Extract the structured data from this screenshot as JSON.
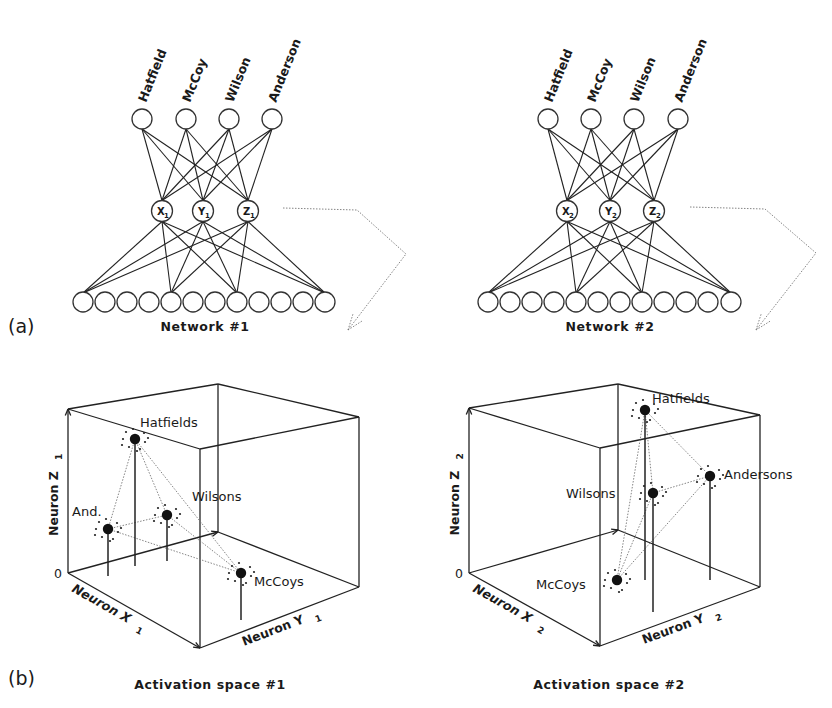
{
  "figure": {
    "panel_a_label": "(a)",
    "panel_b_label": "(b)",
    "colors": {
      "ink": "#1a1a1a",
      "node_stroke": "#333333",
      "dotted": "#777777",
      "background": "#ffffff"
    }
  },
  "networks": [
    {
      "caption": "Network #1",
      "output_labels": [
        "Hatfield",
        "McCoy",
        "Wilson",
        "Anderson"
      ],
      "output_nodes": [
        [
          142,
          119
        ],
        [
          186,
          119
        ],
        [
          229,
          119
        ],
        [
          272,
          119
        ]
      ],
      "hidden_nodes": [
        {
          "letter": "X",
          "sub": "1",
          "x": 162,
          "y": 211
        },
        {
          "letter": "Y",
          "sub": "1",
          "x": 203,
          "y": 211
        },
        {
          "letter": "Z",
          "sub": "1",
          "x": 248,
          "y": 211
        }
      ],
      "input_nodes_x": [
        83,
        105,
        127,
        149,
        171,
        193,
        215,
        237,
        259,
        281,
        303,
        325
      ],
      "input_y": 302,
      "connected_inputs": [
        0,
        4,
        7,
        11
      ],
      "arrow": [
        [
          283,
          208
        ],
        [
          357,
          210
        ],
        [
          406,
          254
        ],
        [
          348,
          330
        ]
      ]
    },
    {
      "caption": "Network #2",
      "output_labels": [
        "Hatfield",
        "McCoy",
        "Wilson",
        "Anderson"
      ],
      "output_nodes": [
        [
          548,
          119
        ],
        [
          591,
          119
        ],
        [
          634,
          119
        ],
        [
          678,
          119
        ]
      ],
      "hidden_nodes": [
        {
          "letter": "X",
          "sub": "2",
          "x": 567,
          "y": 211
        },
        {
          "letter": "Y",
          "sub": "2",
          "x": 610,
          "y": 211
        },
        {
          "letter": "Z",
          "sub": "2",
          "x": 654,
          "y": 211
        }
      ],
      "input_nodes_x": [
        488,
        510,
        532,
        554,
        576,
        598,
        620,
        642,
        664,
        686,
        708,
        731
      ],
      "input_y": 302,
      "connected_inputs": [
        0,
        4,
        7,
        11
      ],
      "arrow": [
        [
          690,
          207
        ],
        [
          765,
          209
        ],
        [
          816,
          253
        ],
        [
          756,
          330
        ]
      ]
    }
  ],
  "activation_spaces": [
    {
      "caption": "Activation space #1",
      "axis_z_label": "Neuron Z",
      "axis_z_sub": "1",
      "axis_x_label": "Neuron X",
      "axis_x_sub": "1",
      "axis_y_label": "Neuron Y",
      "axis_y_sub": "1",
      "origin_label": "0",
      "cube": {
        "tl": [
          68,
          409
        ],
        "bt": [
          218,
          384
        ],
        "tr": [
          359,
          417
        ],
        "ft": [
          200,
          449
        ],
        "bl": [
          68,
          573
        ],
        "fb": [
          200,
          648
        ],
        "rb": [
          359,
          587
        ],
        "bb": [
          218,
          532
        ]
      },
      "clusters": [
        {
          "name": "Hatfields",
          "x": 135,
          "y": 439,
          "base": 566,
          "label_x": 140,
          "label_y": 427
        },
        {
          "name": "And.",
          "x": 108,
          "y": 529,
          "base": 576,
          "label_x": 72,
          "label_y": 516
        },
        {
          "name": "Wilsons",
          "x": 167,
          "y": 515,
          "base": 561,
          "label_x": 192,
          "label_y": 501
        },
        {
          "name": "McCoys",
          "x": 241,
          "y": 573,
          "base": 620,
          "label_x": 254,
          "label_y": 586
        }
      ],
      "links": [
        [
          0,
          1
        ],
        [
          0,
          2
        ],
        [
          0,
          3
        ],
        [
          1,
          2
        ],
        [
          1,
          3
        ],
        [
          2,
          3
        ]
      ]
    },
    {
      "caption": "Activation space #2",
      "axis_z_label": "Neuron Z",
      "axis_z_sub": "2",
      "axis_x_label": "Neuron X",
      "axis_x_sub": "2",
      "axis_y_label": "Neuron Y",
      "axis_y_sub": "2",
      "origin_label": "0",
      "cube": {
        "tl": [
          469,
          408
        ],
        "bt": [
          618,
          384
        ],
        "tr": [
          760,
          415
        ],
        "ft": [
          600,
          448
        ],
        "bl": [
          469,
          573
        ],
        "fb": [
          600,
          646
        ],
        "rb": [
          760,
          587
        ],
        "bb": [
          618,
          530
        ]
      },
      "clusters": [
        {
          "name": "Hatfields",
          "x": 645,
          "y": 410,
          "base": 580,
          "label_x": 652,
          "label_y": 403
        },
        {
          "name": "Wilsons",
          "x": 653,
          "y": 493,
          "base": 612,
          "label_x": 566,
          "label_y": 498
        },
        {
          "name": "Andersons",
          "x": 710,
          "y": 476,
          "base": 580,
          "label_x": 724,
          "label_y": 479
        },
        {
          "name": "McCoys",
          "x": 617,
          "y": 580,
          "base": 580,
          "label_x": 536,
          "label_y": 589
        }
      ],
      "links": [
        [
          0,
          1
        ],
        [
          0,
          2
        ],
        [
          0,
          3
        ],
        [
          1,
          2
        ],
        [
          1,
          3
        ],
        [
          2,
          3
        ]
      ]
    }
  ]
}
